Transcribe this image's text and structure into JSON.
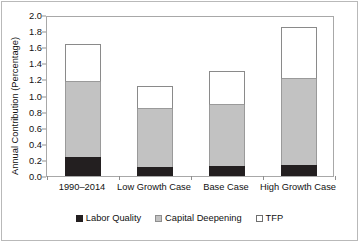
{
  "chart_data": {
    "type": "bar",
    "stacked": true,
    "title": "",
    "xlabel": "",
    "ylabel": "Annual Contribution (Percentage)",
    "ylim": [
      0.0,
      2.0
    ],
    "ytick_labels": [
      "2.0",
      "1.8",
      "1.6",
      "1.4",
      "1.2",
      "1.0",
      "0.8",
      "0.6",
      "0.4",
      "0.2",
      "0.0"
    ],
    "ytick_values": [
      2.0,
      1.8,
      1.6,
      1.4,
      1.2,
      1.0,
      0.8,
      0.6,
      0.4,
      0.2,
      0.0
    ],
    "grid": false,
    "legend_position": "bottom",
    "categories": [
      "1990–2014",
      "Low Growth Case",
      "Base Case",
      "High Growth Case"
    ],
    "series": [
      {
        "name": "Labor Quality",
        "color": "#231f20",
        "values": [
          0.24,
          0.11,
          0.12,
          0.14
        ]
      },
      {
        "name": "Capital Deepening",
        "color": "#c2c2c2",
        "values": [
          0.93,
          0.72,
          0.76,
          1.07
        ]
      },
      {
        "name": "TFP",
        "color": "#ffffff",
        "values": [
          0.47,
          0.29,
          0.42,
          0.64
        ]
      }
    ],
    "totals": [
      1.64,
      1.12,
      1.3,
      1.85
    ]
  },
  "axis": {
    "y_title": "Annual Contribution (Percentage)"
  },
  "legend": {
    "items": [
      {
        "label": "Labor Quality"
      },
      {
        "label": "Capital Deepening"
      },
      {
        "label": "TFP"
      }
    ]
  }
}
